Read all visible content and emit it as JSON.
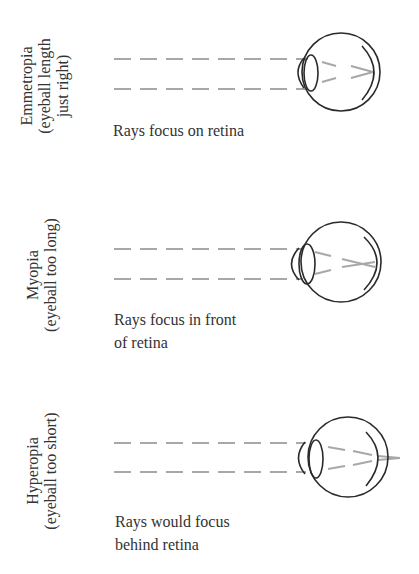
{
  "figure": {
    "panels": [
      {
        "id": "emmetropia",
        "label_lines": [
          "Emmetropia",
          "(eyeball length",
          "just right)"
        ],
        "caption_lines": [
          "Rays focus on retina"
        ],
        "focus": "on retina"
      },
      {
        "id": "myopia",
        "label_lines": [
          "Myopia",
          "(eyeball too long)"
        ],
        "caption_lines": [
          "Rays focus in front",
          "of retina"
        ],
        "focus": "in front of retina"
      },
      {
        "id": "hyperopia",
        "label_lines": [
          "Hyperopia",
          "(eyeball too short)"
        ],
        "caption_lines": [
          "Rays would focus",
          " behind retina"
        ],
        "focus": "behind retina"
      }
    ],
    "colors": {
      "ray": "#a8a8a8",
      "outline": "#2a2a2a",
      "text": "#333333",
      "background": "#ffffff"
    }
  }
}
